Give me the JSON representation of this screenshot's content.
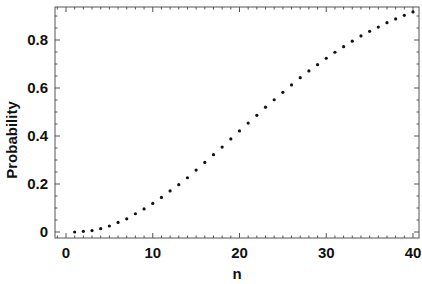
{
  "chart_data": {
    "type": "scatter",
    "title": "",
    "xlabel": "n",
    "ylabel": "Probability",
    "xlim": [
      -1,
      41
    ],
    "ylim": [
      -0.01,
      0.935
    ],
    "xticks": [
      0,
      10,
      20,
      30,
      40
    ],
    "xtick_labels": [
      "0",
      "10",
      "20",
      "30",
      "40"
    ],
    "yticks": [
      0,
      0.2,
      0.4,
      0.6,
      0.8
    ],
    "ytick_labels": [
      "0",
      "0.2",
      "0.4",
      "0.6",
      "0.8"
    ],
    "grid": false,
    "legend": null,
    "series": [
      {
        "name": "Probability",
        "marker": "dot",
        "color": "#111111",
        "x": [
          1,
          2,
          3,
          4,
          5,
          6,
          7,
          8,
          9,
          10,
          11,
          12,
          13,
          14,
          15,
          16,
          17,
          18,
          19,
          20,
          21,
          22,
          23,
          24,
          25,
          26,
          27,
          28,
          29,
          30,
          31,
          32,
          33,
          34,
          35,
          36,
          37,
          38,
          39,
          40
        ],
        "y": [
          0.0,
          0.003,
          0.006,
          0.014,
          0.025,
          0.04,
          0.055,
          0.076,
          0.096,
          0.119,
          0.144,
          0.171,
          0.197,
          0.226,
          0.258,
          0.29,
          0.322,
          0.354,
          0.388,
          0.421,
          0.454,
          0.486,
          0.52,
          0.551,
          0.582,
          0.613,
          0.643,
          0.671,
          0.697,
          0.724,
          0.749,
          0.772,
          0.795,
          0.817,
          0.836,
          0.854,
          0.872,
          0.888,
          0.903,
          0.917
        ]
      }
    ]
  }
}
